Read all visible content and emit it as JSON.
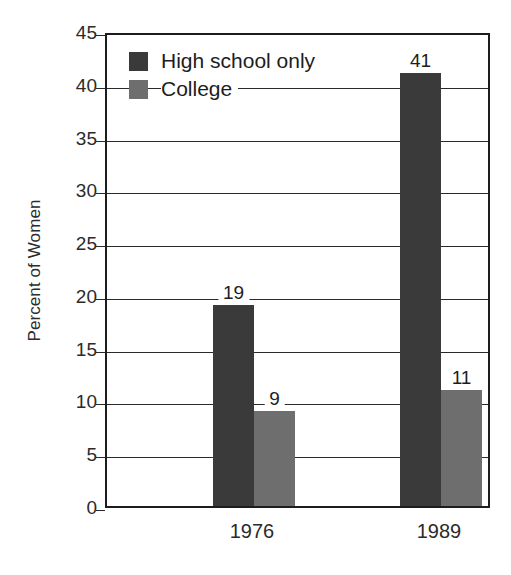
{
  "chart_data": {
    "type": "bar",
    "title": "",
    "xlabel": "",
    "ylabel": "Percent of Women",
    "categories": [
      "1976",
      "1989"
    ],
    "series": [
      {
        "name": "High school only",
        "color": "#3a3a3a",
        "values": [
          19,
          41
        ]
      },
      {
        "name": "College",
        "color": "#6e6e6e",
        "values": [
          9,
          11
        ]
      }
    ],
    "ylim": [
      0,
      45
    ],
    "ytick_step": 5,
    "yticks": [
      "0",
      "5",
      "10",
      "15",
      "20",
      "25",
      "30",
      "35",
      "40",
      "45"
    ],
    "grid": "horizontal",
    "legend_position": "top-left",
    "data_labels": [
      "19",
      "9",
      "41",
      "11"
    ],
    "axis_color": "#1d1d1d",
    "background": "#ffffff"
  },
  "legend": {
    "items": [
      {
        "label": "High school only",
        "color": "#3a3a3a"
      },
      {
        "label": "College",
        "color": "#6e6e6e"
      }
    ]
  }
}
